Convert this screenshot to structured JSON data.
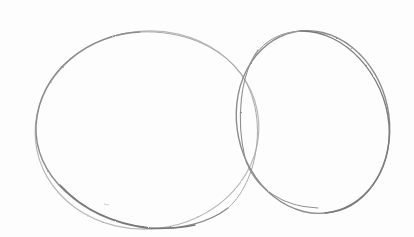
{
  "image": {
    "description": "Pencil sketch of two overlapping ovals on white paper",
    "background_color": "#fdfdfd",
    "stroke_colors": {
      "dark": "#6e6e6e",
      "medium": "#8c8c8c",
      "light": "#b8b8b8"
    },
    "shapes": [
      {
        "name": "left-oval",
        "cx": 147,
        "cy": 130,
        "rx": 112,
        "ry": 99,
        "rotation_deg": -6
      },
      {
        "name": "right-oval",
        "cx": 313,
        "cy": 122,
        "rx": 76,
        "ry": 92,
        "rotation_deg": -12
      },
      {
        "name": "right-oval-second-stroke",
        "cx": 316,
        "cy": 124,
        "rx": 77,
        "ry": 91,
        "rotation_deg": -16
      }
    ]
  }
}
